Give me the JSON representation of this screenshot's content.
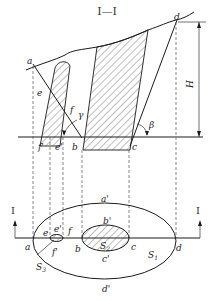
{
  "diagram": {
    "section_title": "I—I",
    "section_marker_left": "I",
    "section_marker_right": "I",
    "elevation_labels": {
      "a": "a",
      "b": "b",
      "c": "c",
      "d": "d",
      "e": "e",
      "f": "f",
      "e_bottom": "e'",
      "f_bottom": "f'",
      "gamma": "γ",
      "beta": "β",
      "H": "H"
    },
    "plan_labels": {
      "a": "a",
      "b": "b",
      "c": "c",
      "d": "d",
      "e": "e",
      "e_prime": "e'",
      "f": "f",
      "f_prime": "f'",
      "a_prime": "a'",
      "b_prime": "b'",
      "c_prime": "c'",
      "d_prime": "d'",
      "S1": "S",
      "S1_sub": "1",
      "S2": "S",
      "S2_sub": "2",
      "S3": "S",
      "S3_sub": "3"
    },
    "colors": {
      "line": "#1a1a1a",
      "hatch": "#444444",
      "dash": "#555555",
      "background": "#ffffff"
    }
  }
}
